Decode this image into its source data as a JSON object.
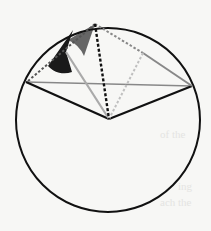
{
  "diagram": {
    "type": "circle-geometry",
    "circle": {
      "cx": 108,
      "cy": 120,
      "r": 92,
      "stroke": "#111111"
    },
    "points": {
      "left": [
        26,
        82
      ],
      "top": [
        95,
        24
      ],
      "right": [
        192,
        86
      ],
      "center": [
        109,
        119
      ],
      "mid_right_chord": [
        143,
        53
      ]
    },
    "colors": {
      "black": "#111111",
      "dark_gray": "#555555",
      "mid_gray": "#888888",
      "light_gray": "#aaaaaa",
      "lighter_gray": "#c0c0c0",
      "angle_dark": "#1a1a1a",
      "angle_gray": "#666666"
    },
    "background_bleed": [
      "of the",
      "ing",
      "ach the"
    ]
  }
}
